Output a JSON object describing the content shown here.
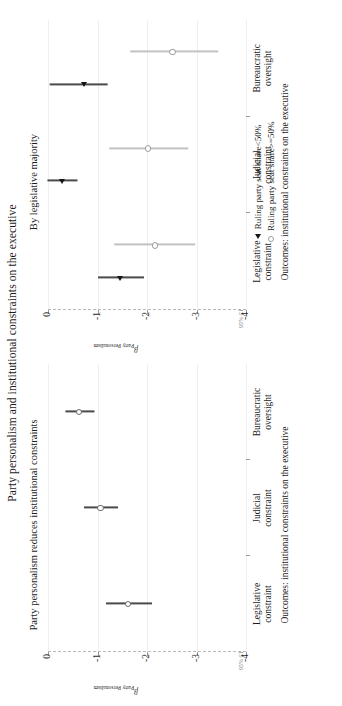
{
  "figure": {
    "title": "Party personalism and institutional constraints on the executive",
    "ci_note": "95% CI",
    "y_axis_label_symbol": "β",
    "y_axis_label_sub": "Party Personalism",
    "x_axis_title": "Outcomes: institutional constraints on the executive"
  },
  "legend": {
    "position": "below-right-panel",
    "entries": [
      {
        "marker": "filled-triangle",
        "label": "Ruling party seat share<50%",
        "color": "#151515"
      },
      {
        "marker": "open-circle",
        "label": "Ruling party seat share>=50%",
        "color": "#9e9e9e"
      }
    ]
  },
  "chart_data": {
    "type": "scatter",
    "title": "Party personalism and institutional constraints on the executive",
    "xlabel": "Outcomes: institutional constraints on the executive",
    "ylabel": "β Party Personalism",
    "ylim": [
      -4,
      0
    ],
    "yticks": [
      0,
      -1,
      -2,
      -3,
      -4
    ],
    "ytick_labels": [
      "0",
      "-1",
      "-2",
      "-3",
      "-4"
    ],
    "grid": true,
    "categories": [
      "Legislative constraint",
      "Judicial constraint",
      "Bureaucratic oversight"
    ],
    "category_labels_wrapped": [
      [
        "Legislative",
        "constraint"
      ],
      [
        "Judicial",
        "constraint"
      ],
      [
        "Bureaucratic",
        "oversight"
      ]
    ],
    "panels": [
      {
        "name": "overall",
        "title": "Party personalism reduces institutional constraints",
        "series": [
          {
            "name": "All countries",
            "marker": "open-circle",
            "color": "#6e6e6e",
            "points": [
              {
                "category": "Legislative constraint",
                "estimate": -1.62,
                "ci_low": -2.08,
                "ci_high": -1.16
              },
              {
                "category": "Judicial constraint",
                "estimate": -1.06,
                "ci_low": -1.4,
                "ci_high": -0.72
              },
              {
                "category": "Bureaucratic oversight",
                "estimate": -0.63,
                "ci_low": -0.92,
                "ci_high": -0.34
              }
            ]
          }
        ]
      },
      {
        "name": "by-legislative-majority",
        "title": "By legislative majority",
        "series": [
          {
            "name": "Ruling party seat share<50%",
            "marker": "filled-triangle",
            "color": "#151515",
            "points": [
              {
                "category": "Legislative constraint",
                "estimate": -1.46,
                "ci_low": -1.92,
                "ci_high": -1.0
              },
              {
                "category": "Judicial constraint",
                "estimate": -0.29,
                "ci_low": -0.59,
                "ci_high": 0.02
              },
              {
                "category": "Bureaucratic oversight",
                "estimate": -0.73,
                "ci_low": -1.2,
                "ci_high": -0.02
              }
            ]
          },
          {
            "name": "Ruling party seat share>=50%",
            "marker": "open-circle",
            "color": "#c2c2c2",
            "points": [
              {
                "category": "Legislative constraint",
                "estimate": -2.16,
                "ci_low": -2.96,
                "ci_high": -1.32
              },
              {
                "category": "Judicial constraint",
                "estimate": -2.02,
                "ci_low": -2.82,
                "ci_high": -1.22
              },
              {
                "category": "Bureaucratic oversight",
                "estimate": -2.52,
                "ci_low": -3.42,
                "ci_high": -1.64
              }
            ]
          }
        ]
      }
    ]
  }
}
